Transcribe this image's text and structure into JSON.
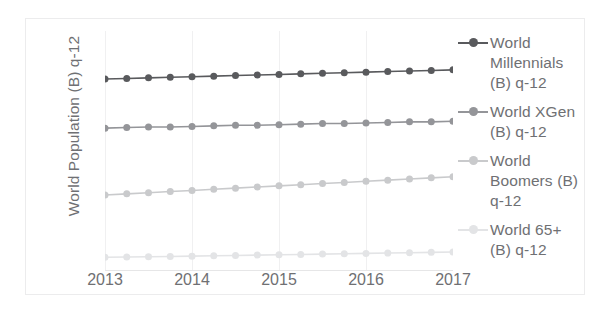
{
  "chart_data": {
    "type": "line",
    "title": "",
    "xlabel": "",
    "ylabel": "World Population (B) q-12",
    "x_tick_labels": [
      "2013",
      "2014",
      "2015",
      "2016",
      "2017"
    ],
    "x_tick_values": [
      2013,
      2014,
      2015,
      2016,
      2017
    ],
    "xlim": [
      2013,
      2017
    ],
    "ylim": [
      0,
      4.2
    ],
    "grid": "vertical-only",
    "legend_position": "right",
    "x": [
      2013,
      2013.25,
      2013.5,
      2013.75,
      2014,
      2014.25,
      2014.5,
      2014.75,
      2015,
      2015.25,
      2015.5,
      2015.75,
      2016,
      2016.25,
      2016.5,
      2016.75,
      2017
    ],
    "series": [
      {
        "name": "World Millennials (B) q-12",
        "color": "#595a5d",
        "values": [
          3.36,
          3.37,
          3.38,
          3.39,
          3.4,
          3.41,
          3.42,
          3.43,
          3.44,
          3.45,
          3.46,
          3.47,
          3.48,
          3.49,
          3.5,
          3.51,
          3.52
        ]
      },
      {
        "name": "World XGen (B) q-12",
        "color": "#949599",
        "values": [
          2.5,
          2.51,
          2.52,
          2.52,
          2.53,
          2.54,
          2.55,
          2.55,
          2.56,
          2.57,
          2.58,
          2.58,
          2.59,
          2.6,
          2.61,
          2.61,
          2.62
        ]
      },
      {
        "name": "World Boomers (B) q-12",
        "color": "#c9cacc",
        "values": [
          1.33,
          1.35,
          1.37,
          1.39,
          1.41,
          1.43,
          1.45,
          1.47,
          1.49,
          1.51,
          1.53,
          1.55,
          1.57,
          1.59,
          1.61,
          1.63,
          1.65
        ]
      },
      {
        "name": "World 65+ (B) q-12",
        "color": "#e3e4e6",
        "values": [
          0.24,
          0.245,
          0.25,
          0.255,
          0.26,
          0.266,
          0.272,
          0.278,
          0.284,
          0.29,
          0.296,
          0.302,
          0.308,
          0.314,
          0.32,
          0.326,
          0.332
        ]
      }
    ]
  },
  "legend": {
    "entries": [
      {
        "label": "World Millennials (B) q-12",
        "color": "#595a5d"
      },
      {
        "label": "World XGen (B) q-12",
        "color": "#949599"
      },
      {
        "label": "World Boomers (B) q-12",
        "color": "#c9cacc"
      },
      {
        "label": "World 65+ (B) q-12",
        "color": "#e3e4e6"
      }
    ]
  },
  "style": {
    "frame_border": "#ececed",
    "gridline": "#f0f0f1",
    "axis_line": "#e6e6e7",
    "text": "#6f7073"
  }
}
